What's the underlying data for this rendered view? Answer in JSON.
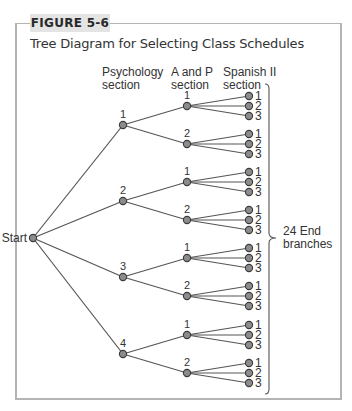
{
  "figure": {
    "label": "FIGURE 5-6",
    "title": "Tree Diagram for Selecting Class Schedules"
  },
  "columns": {
    "psychology": [
      "Psychology",
      "section"
    ],
    "anp": [
      "A and P",
      "section"
    ],
    "spanish": [
      "Spanish II",
      "section"
    ]
  },
  "start_label": "Start",
  "end_annotation": [
    "24 End",
    "branches"
  ],
  "tree": {
    "psychology_sections": [
      "1",
      "2",
      "3",
      "4"
    ],
    "anp_sections": [
      "1",
      "2"
    ],
    "spanish_sections": [
      "1",
      "2",
      "3"
    ],
    "total_end_branches": 24
  },
  "colors": {
    "node_fill": "#8c8c8c",
    "node_stroke": "#3a3a3a",
    "line": "#555555",
    "frame": "#b4b4b4",
    "label_bg": "#e4e4e4"
  }
}
